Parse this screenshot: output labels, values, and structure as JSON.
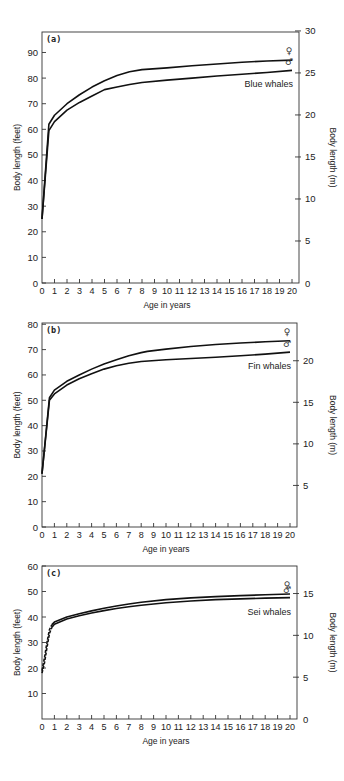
{
  "chart_data": [
    {
      "type": "line",
      "panel": "(a)",
      "title": "Blue whales",
      "xlabel": "Age in years",
      "ylabel": "Body length (feet)",
      "ylabel_right": "Body length (m)",
      "xlim": [
        0,
        20
      ],
      "ylim": [
        0,
        98
      ],
      "xticks": [
        0,
        1,
        2,
        3,
        4,
        5,
        6,
        7,
        8,
        9,
        10,
        11,
        12,
        13,
        14,
        15,
        16,
        17,
        18,
        19,
        20
      ],
      "yticks": [
        0,
        10,
        20,
        30,
        40,
        50,
        60,
        70,
        80,
        90
      ],
      "yticks_right": [
        0,
        5,
        10,
        15,
        20,
        25,
        30
      ],
      "grid": false,
      "series": [
        {
          "name": "Female",
          "symbol": "♀",
          "x": [
            0,
            0.55,
            1,
            2,
            3,
            4,
            5,
            6,
            7,
            8,
            10,
            12,
            14,
            16,
            18,
            20
          ],
          "y": [
            25,
            62,
            65.5,
            70,
            73.5,
            76.5,
            79,
            81,
            82.5,
            83.3,
            84,
            84.8,
            85.5,
            86.2,
            86.7,
            87
          ]
        },
        {
          "name": "Male",
          "symbol": "♂",
          "x": [
            0,
            0.55,
            1,
            2,
            3,
            4,
            5,
            6,
            7,
            8,
            10,
            12,
            14,
            16,
            18,
            20
          ],
          "y": [
            25,
            59.5,
            63,
            67.5,
            70.5,
            73,
            75.5,
            76.5,
            77.5,
            78.3,
            79.2,
            80,
            80.8,
            81.5,
            82.2,
            83
          ]
        }
      ]
    },
    {
      "type": "line",
      "panel": "(b)",
      "title": "Fin whales",
      "xlabel": "Age in years",
      "ylabel": "Body length (feet)",
      "ylabel_right": "Body length (m)",
      "xlim": [
        0,
        20
      ],
      "ylim": [
        0,
        80
      ],
      "xticks": [
        0,
        1,
        2,
        3,
        4,
        5,
        6,
        7,
        8,
        9,
        10,
        11,
        12,
        13,
        14,
        15,
        16,
        17,
        18,
        19,
        20
      ],
      "yticks": [
        0,
        10,
        20,
        30,
        40,
        50,
        60,
        70,
        80
      ],
      "yticks_right": [
        5,
        10,
        15,
        20
      ],
      "grid": false,
      "series": [
        {
          "name": "Female",
          "symbol": "♀",
          "x": [
            0,
            0.6,
            1,
            2,
            3,
            4,
            5,
            6,
            7,
            8,
            8.5,
            10,
            12,
            14,
            16,
            18,
            20
          ],
          "y": [
            21,
            51,
            54,
            57.5,
            60,
            62.3,
            64.3,
            66,
            67.6,
            68.8,
            69.3,
            70.2,
            71.2,
            72,
            72.6,
            73.1,
            73.5
          ]
        },
        {
          "name": "Male",
          "symbol": "♂",
          "x": [
            0,
            0.6,
            1,
            2,
            3,
            4,
            5,
            6,
            7,
            8,
            10,
            12,
            14,
            16,
            18,
            20
          ],
          "y": [
            21,
            50,
            52.5,
            56,
            58.5,
            60.5,
            62.3,
            63.6,
            64.6,
            65.3,
            66,
            66.5,
            67,
            67.6,
            68.2,
            69
          ]
        }
      ]
    },
    {
      "type": "line",
      "panel": "(c)",
      "title": "Sei whales",
      "xlabel": "Age in years",
      "ylabel": "Body length (feet)",
      "ylabel_right": "Body length (m)",
      "xlim": [
        0,
        20
      ],
      "ylim": [
        0,
        60
      ],
      "xticks": [
        0,
        1,
        2,
        3,
        4,
        5,
        6,
        7,
        8,
        9,
        10,
        11,
        12,
        13,
        14,
        15,
        16,
        17,
        18,
        19,
        20
      ],
      "yticks": [
        10,
        20,
        30,
        40,
        50,
        60
      ],
      "yticks_right": [
        0,
        5,
        10,
        15
      ],
      "grid": false,
      "series": [
        {
          "name": "Female",
          "symbol": "♀",
          "dashed_until": 0.8,
          "x": [
            0,
            0.2,
            0.4,
            0.6,
            0.8,
            1,
            2,
            3,
            4,
            5,
            6,
            7,
            8,
            10,
            12,
            14,
            16,
            18,
            20
          ],
          "y": [
            19,
            24,
            30,
            35,
            37,
            38,
            40,
            41.3,
            42.4,
            43.4,
            44.3,
            45.1,
            45.8,
            46.8,
            47.5,
            48,
            48.4,
            48.7,
            49
          ]
        },
        {
          "name": "Male",
          "symbol": "♂",
          "dashed_until": 0.8,
          "x": [
            0,
            0.2,
            0.4,
            0.6,
            0.8,
            1,
            2,
            3,
            4,
            5,
            6,
            7,
            8,
            10,
            12,
            14,
            16,
            18,
            20
          ],
          "y": [
            18,
            22,
            28,
            33.5,
            36,
            37.2,
            39.2,
            40.5,
            41.6,
            42.5,
            43.3,
            44,
            44.6,
            45.6,
            46.3,
            46.8,
            47.1,
            47.4,
            47.6
          ]
        }
      ]
    }
  ],
  "panels": [
    {
      "label": "(a)",
      "species": "Blue whales",
      "xlabel": "Age in years",
      "ylabel": "Body length (feet)",
      "ylabel_right": "Body length (m)",
      "female_symbol": "♀",
      "male_symbol": "♂",
      "layout": {
        "x0": 42,
        "x1": 299,
        "xend": 292,
        "top": 32,
        "bottom": 283,
        "ymax": 98,
        "right_m_max": 29.87
      }
    },
    {
      "label": "(b)",
      "species": "Fin whales",
      "xlabel": "Age in years",
      "ylabel": "Body length (feet)",
      "ylabel_right": "Body length (m)",
      "female_symbol": "♀",
      "male_symbol": "♂",
      "layout": {
        "x0": 42,
        "x1": 297,
        "xend": 290,
        "top": 323,
        "bottom": 527,
        "ymax": 80.5,
        "right_m_max": 24.54
      }
    },
    {
      "label": "(c)",
      "species": "Sei whales",
      "xlabel": "Age in years",
      "ylabel": "Body length (feet)",
      "ylabel_right": "Body length (m)",
      "female_symbol": "♀",
      "male_symbol": "♂",
      "layout": {
        "x0": 42,
        "x1": 297,
        "xend": 290,
        "top": 566,
        "bottom": 719,
        "ymax": 60,
        "right_m_max": 18.29
      }
    }
  ]
}
